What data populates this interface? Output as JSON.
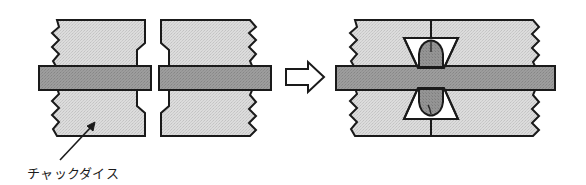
{
  "figure": {
    "background_color": "#ffffff",
    "line_color": "#1a1a1a",
    "die_fill_color": "#d8d8d8",
    "die_texture_color": "#c4c4c4",
    "bar_fill_color": "#9a9a9a",
    "bar_texture_color": "#8a8a8a",
    "upset_fill_color": "#8f8f8f",
    "arrow_fill_color": "#ffffff"
  },
  "left_stage": {
    "name": "before-forming",
    "description": "Two pairs of chuck dies gripping a rod, jaws open",
    "upper_left_die": {
      "label": "upper-left-chuck-die"
    },
    "lower_left_die": {
      "label": "lower-left-chuck-die"
    },
    "upper_right_die": {
      "label": "upper-right-chuck-die"
    },
    "lower_right_die": {
      "label": "lower-right-chuck-die"
    },
    "workpiece_bar": {
      "label": "workpiece-rod"
    }
  },
  "process_arrow": {
    "name": "process-arrow",
    "direction": "right",
    "style": "hollow-outline"
  },
  "right_stage": {
    "name": "after-forming",
    "description": "Chuck dies closed, material upset into the bowtie cavity",
    "upper_die": {
      "label": "upper-chuck-die-closed"
    },
    "lower_die": {
      "label": "lower-chuck-die-closed"
    },
    "workpiece_bar": {
      "label": "workpiece-rod"
    },
    "upset_head": {
      "label": "upset-formed-head"
    },
    "parting_line": {
      "label": "die-parting-line"
    }
  },
  "annotation": {
    "name": "chuck-dies-label",
    "text": "チャックダイス",
    "romaji_meaning": "chuck dies",
    "leader": {
      "label": "leader-line-with-arrowhead"
    }
  }
}
